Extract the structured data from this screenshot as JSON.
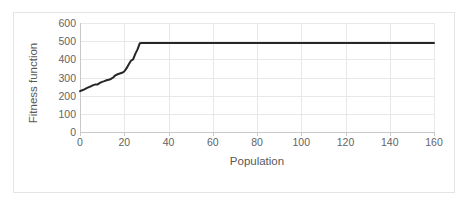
{
  "chart_data": {
    "type": "line",
    "title": "",
    "xlabel": "Population",
    "ylabel": "Fitness function",
    "xlim": [
      0,
      160
    ],
    "ylim": [
      0,
      600
    ],
    "xticks": [
      0,
      20,
      40,
      60,
      80,
      100,
      120,
      140,
      160
    ],
    "yticks": [
      0,
      100,
      200,
      300,
      400,
      500,
      600
    ],
    "grid": true,
    "legend": null,
    "series": [
      {
        "name": "Fitness function",
        "color": "#262626",
        "x": [
          0,
          1,
          2,
          3,
          4,
          5,
          6,
          7,
          8,
          9,
          10,
          11,
          12,
          13,
          14,
          15,
          16,
          17,
          18,
          19,
          20,
          21,
          22,
          23,
          24,
          25,
          26,
          27,
          28,
          30,
          35,
          40,
          45,
          50,
          55,
          60,
          65,
          70,
          75,
          80,
          85,
          90,
          95,
          100,
          105,
          110,
          115,
          120,
          125,
          130,
          135,
          140,
          145,
          150,
          155,
          160
        ],
        "y": [
          225,
          230,
          235,
          241,
          247,
          252,
          258,
          262,
          262,
          270,
          276,
          280,
          285,
          288,
          292,
          300,
          312,
          318,
          322,
          326,
          333,
          350,
          372,
          392,
          400,
          430,
          455,
          488,
          490,
          490,
          490,
          490,
          490,
          490,
          490,
          490,
          490,
          490,
          490,
          490,
          490,
          490,
          490,
          490,
          490,
          490,
          490,
          490,
          490,
          490,
          490,
          490,
          490,
          490,
          490,
          490
        ]
      }
    ]
  },
  "axes": {
    "y_tick_labels": [
      "600",
      "500",
      "400",
      "300",
      "200",
      "100",
      "0"
    ],
    "x_tick_labels": [
      "0",
      "20",
      "40",
      "60",
      "80",
      "100",
      "120",
      "140",
      "160"
    ],
    "x_title": "Population",
    "y_title": "Fitness function"
  },
  "colors": {
    "series_line": "#262626",
    "gridline": "#e8e8e8",
    "axis": "#c9c9c9",
    "tick_text": "#636363",
    "title_text": "#595959",
    "frame": "#e4e4e4",
    "background": "#ffffff"
  }
}
